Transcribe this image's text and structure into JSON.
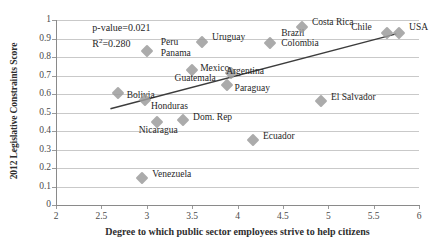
{
  "chart_data": {
    "type": "scatter",
    "title": "",
    "xlabel": "Degree to which public sector employees strive to help citizens",
    "ylabel": "2012 Legislative Constraints Score",
    "xlim": [
      2,
      6
    ],
    "ylim": [
      0,
      1
    ],
    "xticks": [
      "2",
      "2.5",
      "3",
      "3.5",
      "4",
      "4.5",
      "5",
      "5.5",
      "6"
    ],
    "xtick_values": [
      2,
      2.5,
      3,
      3.5,
      4,
      4.5,
      5,
      5.5,
      6
    ],
    "yticks": [
      "0",
      "0.1",
      "0.2",
      "0.3",
      "0.4",
      "0.5",
      "0.6",
      "0.7",
      "0.8",
      "0.9",
      "1"
    ],
    "ytick_values": [
      0,
      0.1,
      0.2,
      0.3,
      0.4,
      0.5,
      0.6,
      0.7,
      0.8,
      0.9,
      1
    ],
    "grid": "horizontal",
    "legend": "none",
    "annotations": [
      {
        "text": "p-value=0.021",
        "x": 2.4,
        "y": 0.955
      },
      {
        "text": "R2=0.280",
        "x": 2.4,
        "y": 0.875
      }
    ],
    "trendline": {
      "x_start": 2.6,
      "y_start": 0.52,
      "x_end": 5.75,
      "y_end": 0.925
    },
    "points": [
      {
        "label": "Peru",
        "x": 3.0,
        "y": 0.835,
        "label_dx": 14,
        "label_dy": -9
      },
      {
        "label": "Panama",
        "x": 3.0,
        "y": 0.835,
        "label_dx": 14,
        "label_dy": 2
      },
      {
        "label": "Uruguay",
        "x": 3.61,
        "y": 0.88,
        "label_dx": 10,
        "label_dy": -5
      },
      {
        "label": "Brazil",
        "x": 4.36,
        "y": 0.875,
        "label_dx": 11,
        "label_dy": -10
      },
      {
        "label": "Colombia",
        "x": 4.36,
        "y": 0.875,
        "label_dx": 11,
        "label_dy": 0
      },
      {
        "label": "Costa Rica",
        "x": 4.71,
        "y": 0.96,
        "label_dx": 10,
        "label_dy": -5
      },
      {
        "label": "Chile",
        "x": 5.65,
        "y": 0.93,
        "label_dx": -36,
        "label_dy": -6
      },
      {
        "label": "USA",
        "x": 5.78,
        "y": 0.93,
        "label_dx": 10,
        "label_dy": -6
      },
      {
        "label": "Mexico",
        "x": 3.5,
        "y": 0.73,
        "label_dx": 8,
        "label_dy": -2
      },
      {
        "label": "Argentina",
        "x": 3.93,
        "y": 0.715,
        "label_dx": -5,
        "label_dy": -2
      },
      {
        "label": "Guatemala",
        "x": 3.88,
        "y": 0.65,
        "label_dx": -52,
        "label_dy": -7
      },
      {
        "label": "Paraguay",
        "x": 3.88,
        "y": 0.65,
        "label_dx": 8,
        "label_dy": 3
      },
      {
        "label": "Bolivia",
        "x": 2.68,
        "y": 0.605,
        "label_dx": 9,
        "label_dy": 2
      },
      {
        "label": "Honduras",
        "x": 2.98,
        "y": 0.565,
        "label_dx": 6,
        "label_dy": 6
      },
      {
        "label": "El Salvador",
        "x": 4.92,
        "y": 0.56,
        "label_dx": 10,
        "label_dy": -4
      },
      {
        "label": "Nicaragua",
        "x": 3.11,
        "y": 0.45,
        "label_dx": -18,
        "label_dy": 8
      },
      {
        "label": "Dom. Rep",
        "x": 3.4,
        "y": 0.46,
        "label_dx": 10,
        "label_dy": -3
      },
      {
        "label": "Ecuador",
        "x": 4.17,
        "y": 0.35,
        "label_dx": 10,
        "label_dy": -4
      },
      {
        "label": "Venezuela",
        "x": 2.95,
        "y": 0.145,
        "label_dx": 10,
        "label_dy": -4
      }
    ]
  }
}
